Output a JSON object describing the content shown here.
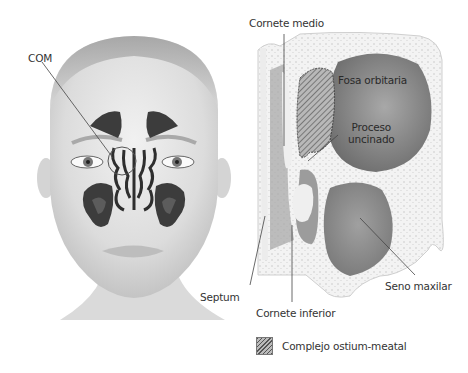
{
  "figure": {
    "left_panel": "frontal face view with paranasal sinuses",
    "right_panel": "coronal section of nasal cavity and maxillary sinus"
  },
  "labels": {
    "com": "COM",
    "cornete_medio": "Cornete medio",
    "fosa_orbitaria": "Fosa orbitaria",
    "proceso_uncinado_1": "Proceso",
    "proceso_uncinado_2": "uncinado",
    "septum": "Septum",
    "cornete_inferior": "Cornete inferior",
    "seno_maxilar": "Seno maxilar"
  },
  "legend": {
    "swatch": "hatched-pattern",
    "text": "Complejo ostium-meatal"
  },
  "colors": {
    "background": "#ffffff",
    "skin": "#e6e6e6",
    "sinus_dark": "#3c3c3c",
    "bone": "#f2f2f2",
    "cavity": "#8a8a8a",
    "leader_line": "#444444"
  }
}
